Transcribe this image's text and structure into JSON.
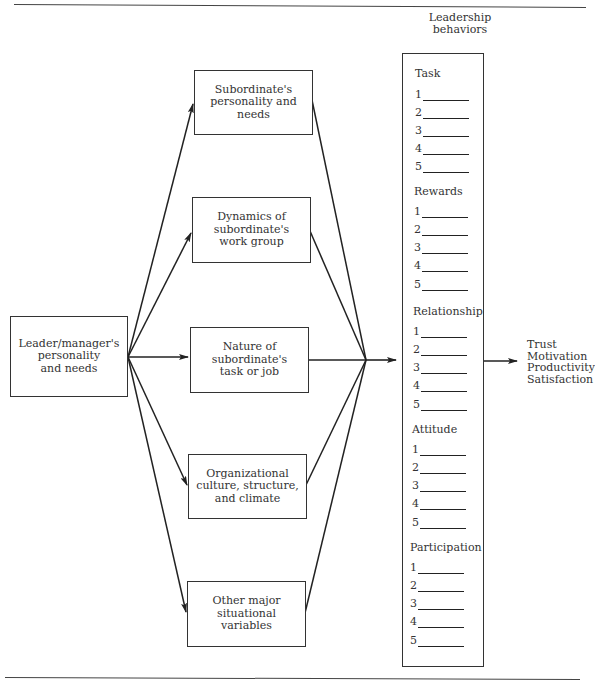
{
  "header": {
    "fragment": "g  a  d  e  r  s  h  i  p"
  },
  "diagram": {
    "source": {
      "label": "Leader/manager's\npersonality\nand needs"
    },
    "factors": [
      {
        "label": "Subordinate's\npersonality and\nneeds"
      },
      {
        "label": "Dynamics of\nsubordinate's\nwork group"
      },
      {
        "label": "Nature of\nsubordinate's\ntask or job"
      },
      {
        "label": "Organizational\nculture, structure,\nand climate"
      },
      {
        "label": "Other major\nsituational\nvariables"
      }
    ],
    "behaviors": {
      "title": "Leadership\nbehaviors",
      "sections": [
        {
          "title": "Task",
          "items": [
            "1",
            "2",
            "3",
            "4",
            "5"
          ]
        },
        {
          "title": "Rewards",
          "items": [
            "1",
            "2",
            "3",
            "4",
            "5"
          ]
        },
        {
          "title": "Relationship",
          "items": [
            "1",
            "2",
            "3",
            "4",
            "5"
          ]
        },
        {
          "title": "Attitude",
          "items": [
            "1",
            "2",
            "3",
            "4",
            "5"
          ]
        },
        {
          "title": "Participation",
          "items": [
            "1",
            "2",
            "3",
            "4",
            "5"
          ]
        }
      ]
    },
    "outcomes": [
      "Trust",
      "Motivation",
      "Productivity",
      "Satisfaction"
    ],
    "colors": {
      "line": "#222222",
      "text": "#333333",
      "background": "#ffffff"
    }
  }
}
